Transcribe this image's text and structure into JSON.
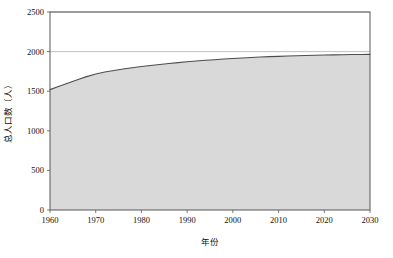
{
  "chart_data": {
    "type": "area",
    "title": "",
    "xlabel": "年份",
    "ylabel": "总人口数（人）",
    "xlim": [
      1960,
      2030
    ],
    "ylim": [
      0,
      2500
    ],
    "grid": true,
    "legend": "none",
    "x_ticks": [
      "1960",
      "1970",
      "1980",
      "1990",
      "2000",
      "2010",
      "2020",
      "2030"
    ],
    "y_ticks": [
      "0",
      "500",
      "1000",
      "1500",
      "2000",
      "2500"
    ],
    "series": [
      {
        "name": "总人口数",
        "line_color": "#4d4d4d",
        "fill_color": "#d9d9d9",
        "x": [
          1960,
          1962,
          1964,
          1966,
          1968,
          1970,
          1972,
          1974,
          1976,
          1978,
          1980,
          1982,
          1984,
          1986,
          1988,
          1990,
          1992,
          1994,
          1996,
          1998,
          2000,
          2002,
          2004,
          2006,
          2008,
          2010,
          2012,
          2014,
          2016,
          2018,
          2020,
          2022,
          2024,
          2026,
          2028,
          2030
        ],
        "values": [
          1520,
          1562,
          1604,
          1645,
          1684,
          1718,
          1742,
          1762,
          1780,
          1796,
          1811,
          1825,
          1838,
          1850,
          1861,
          1871,
          1881,
          1890,
          1898,
          1906,
          1913,
          1920,
          1926,
          1931,
          1936,
          1940,
          1944,
          1948,
          1951,
          1954,
          1957,
          1959,
          1961,
          1963,
          1964,
          1965
        ]
      }
    ]
  },
  "colors": {
    "plot_border": "#595959",
    "gridline": "#a6a6a6",
    "area_fill": "#d9d9d9",
    "line": "#4d4d4d",
    "plot_background": "#ffffff",
    "page_background": "#ffffff"
  },
  "geometry": {
    "plot_left": 50,
    "plot_right": 370,
    "plot_top": 12,
    "plot_bottom": 210
  }
}
